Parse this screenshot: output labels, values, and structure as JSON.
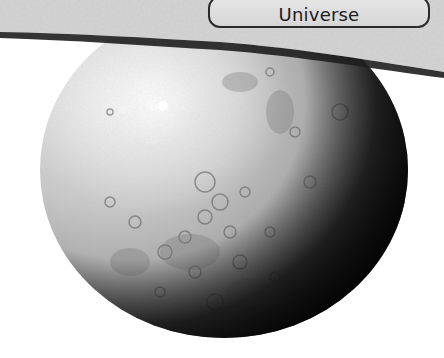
{
  "header": {
    "button_label": "Universe"
  },
  "scene": {
    "object": "moon-sphere",
    "background_color": "#ffffff",
    "band_color": "#d4d4d4",
    "shadow_color": "#1e1e1e",
    "button_border_color": "#2a2a2a",
    "button_fill_color": "#dedede"
  }
}
